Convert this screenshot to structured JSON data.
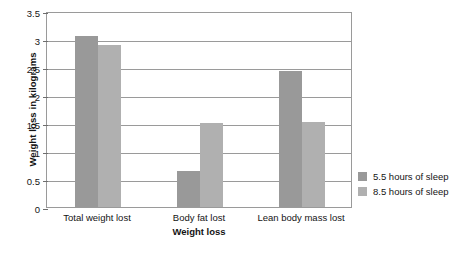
{
  "chart_data": {
    "type": "bar",
    "title": "",
    "xlabel": "Weight loss",
    "ylabel": "Weight loss in kilograms",
    "categories": [
      "Total weight lost",
      "Body fat lost",
      "Lean body mass lost"
    ],
    "series": [
      {
        "name": "5.5 hours of sleep",
        "color": "#999999",
        "values": [
          3.05,
          0.65,
          2.42
        ]
      },
      {
        "name": "8.5 hours of sleep",
        "color": "#b0b0b0",
        "values": [
          2.9,
          1.5,
          1.52
        ]
      }
    ],
    "ylim": [
      0,
      3.5
    ],
    "yticks": [
      "0",
      "0.5",
      "1",
      "1.5",
      "2",
      "2.5",
      "3",
      "3.5"
    ],
    "ytick_values": [
      0,
      0.5,
      1,
      1.5,
      2,
      2.5,
      3,
      3.5
    ],
    "grid": true,
    "legend_position": "right-outside"
  }
}
